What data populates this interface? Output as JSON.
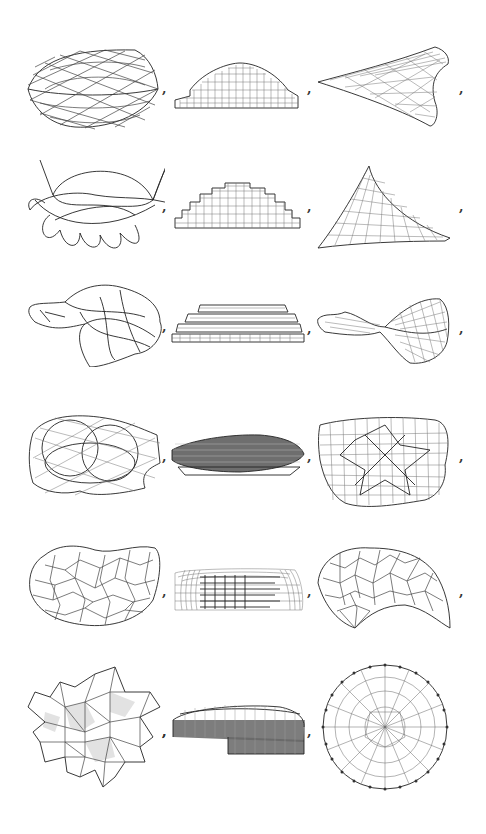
{
  "figure": {
    "rows": 6,
    "columns": 3,
    "separator": ",",
    "background": "#ffffff",
    "line_color": "#444444",
    "items": [
      {
        "row": 1,
        "col": 1,
        "shape": "lens-shaped ellipsoid net",
        "separator": ","
      },
      {
        "row": 1,
        "col": 2,
        "shape": "stepped dome grid",
        "separator": ","
      },
      {
        "row": 1,
        "col": 3,
        "shape": "arrowhead / kite grid surface",
        "separator": ","
      },
      {
        "row": 2,
        "col": 1,
        "shape": "looped curve tangle with petals",
        "separator": ","
      },
      {
        "row": 2,
        "col": 2,
        "shape": "stepped semicircle grid",
        "separator": ","
      },
      {
        "row": 2,
        "col": 3,
        "shape": "triangular tent grid surface",
        "separator": ","
      },
      {
        "row": 3,
        "col": 1,
        "shape": "bulbous irregular blob net",
        "separator": ","
      },
      {
        "row": 3,
        "col": 2,
        "shape": "stacked layered disc slabs",
        "separator": ","
      },
      {
        "row": 3,
        "col": 3,
        "shape": "twisted fish-like grid surface",
        "separator": ","
      },
      {
        "row": 4,
        "col": 1,
        "shape": "tangled rings net",
        "separator": ","
      },
      {
        "row": 4,
        "col": 2,
        "shape": "dense elongated disc",
        "separator": ","
      },
      {
        "row": 4,
        "col": 3,
        "shape": "distorted square grid with star",
        "separator": ","
      },
      {
        "row": 5,
        "col": 1,
        "shape": "kidney-shaped triangulated mesh",
        "separator": ","
      },
      {
        "row": 5,
        "col": 2,
        "shape": "rounded box wireframe",
        "separator": ","
      },
      {
        "row": 5,
        "col": 3,
        "shape": "paisley / comma-shaped cellular mesh",
        "separator": ","
      },
      {
        "row": 6,
        "col": 1,
        "shape": "six-pointed star mesh",
        "separator": ","
      },
      {
        "row": 6,
        "col": 2,
        "shape": "dense ring band wireframe",
        "separator": ","
      },
      {
        "row": 6,
        "col": 3,
        "shape": "circular voronoi-like mesh",
        "separator": ""
      }
    ]
  }
}
